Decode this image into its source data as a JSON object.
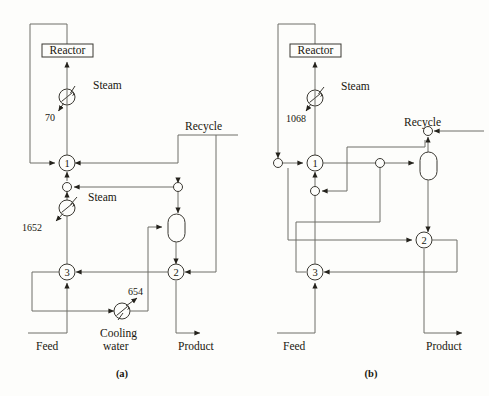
{
  "figure": {
    "type": "process-flow-diagram",
    "panels": [
      {
        "id": "a",
        "caption": "(a)",
        "units": [
          {
            "name": "Reactor",
            "label": "Reactor",
            "shape": "rectangle"
          },
          {
            "name": "steam-heater-top",
            "shape": "circle-exchanger",
            "utility": "Steam",
            "duty": "70"
          },
          {
            "name": "mixer-1",
            "label": "1",
            "shape": "circle"
          },
          {
            "name": "steam-heater-lower",
            "shape": "circle-exchanger",
            "utility": "Steam",
            "duty": "1652"
          },
          {
            "name": "splitter-3",
            "label": "3",
            "shape": "circle"
          },
          {
            "name": "exchanger-2",
            "label": "2",
            "shape": "circle"
          },
          {
            "name": "flash-vessel",
            "shape": "capsule"
          },
          {
            "name": "cooler",
            "shape": "circle-exchanger",
            "utility": "Cooling water",
            "duty": "654"
          }
        ],
        "streams": [
          {
            "name": "feed-stream",
            "label": "Feed"
          },
          {
            "name": "product-stream",
            "label": "Product"
          },
          {
            "name": "recycle-stream",
            "label": "Recycle"
          }
        ],
        "labels": {
          "reactor": "Reactor",
          "steam_top": "Steam",
          "duty_top": "70",
          "recycle": "Recycle",
          "steam_lower": "Steam",
          "duty_lower": "1652",
          "duty_cooler": "654",
          "cooling_water_line1": "Cooling",
          "cooling_water_line2": "water",
          "feed": "Feed",
          "product": "Product",
          "mixer_1": "1",
          "unit_2": "2",
          "unit_3": "3",
          "caption": "(a)"
        }
      },
      {
        "id": "b",
        "caption": "(b)",
        "units": [
          {
            "name": "Reactor",
            "label": "Reactor",
            "shape": "rectangle"
          },
          {
            "name": "steam-heater-top",
            "shape": "circle-exchanger",
            "utility": "Steam",
            "duty": "1068"
          },
          {
            "name": "mixer-1",
            "label": "1",
            "shape": "circle"
          },
          {
            "name": "exchanger-2",
            "label": "2",
            "shape": "circle"
          },
          {
            "name": "splitter-3",
            "label": "3",
            "shape": "circle"
          },
          {
            "name": "flash-vessel",
            "shape": "capsule"
          }
        ],
        "streams": [
          {
            "name": "feed-stream",
            "label": "Feed"
          },
          {
            "name": "product-stream",
            "label": "Product"
          },
          {
            "name": "recycle-stream",
            "label": "Recycle"
          }
        ],
        "labels": {
          "reactor": "Reactor",
          "steam_top": "Steam",
          "duty_top": "1068",
          "recycle": "Recycle",
          "feed": "Feed",
          "product": "Product",
          "mixer_1": "1",
          "unit_2": "2",
          "unit_3": "3",
          "caption": "(b)"
        }
      }
    ]
  },
  "colors": {
    "line": "#6f6e69",
    "line_dark": "#3a3832",
    "text": "#19170f",
    "background": "#fdfdfb"
  }
}
